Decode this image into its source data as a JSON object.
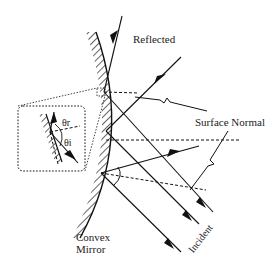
{
  "diagram": {
    "labels": {
      "reflected": "Reflected",
      "surface_normal": "Surface Normal",
      "convex": "Convex",
      "mirror": "Mirror",
      "incident": "Incident",
      "theta_r": "θr",
      "theta_i": "θi"
    },
    "elements": [
      {
        "id": "convex-mirror",
        "type": "curved hatched surface"
      },
      {
        "id": "inset-box",
        "type": "dotted rounded rectangle showing close-up of reflection angles"
      },
      {
        "id": "incident-rays",
        "count": 3
      },
      {
        "id": "reflected-rays",
        "count": 3
      },
      {
        "id": "surface-normals",
        "count": 3,
        "style": "dashed"
      }
    ],
    "colors": {
      "ink": "#111111",
      "background": "#ffffff"
    }
  }
}
